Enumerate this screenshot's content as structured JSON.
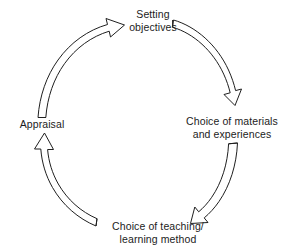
{
  "diagram": {
    "type": "cycle-diagram",
    "direction": "clockwise",
    "background_color": "#ffffff",
    "line_color": "#1f1f1f",
    "text_color": "#1c1c1c",
    "nodes": [
      {
        "id": "setting-objectives",
        "label": "Setting\nobjectives",
        "position": "top"
      },
      {
        "id": "choice-materials",
        "label": "Choice of materials\nand experiences",
        "position": "right"
      },
      {
        "id": "choice-teaching",
        "label": "Choice of teaching/\nlearning method",
        "position": "bottom"
      },
      {
        "id": "appraisal",
        "label": "Appraisal",
        "position": "left"
      }
    ],
    "arrows": [
      {
        "id": "arrow-objectives-to-materials",
        "from": "setting-objectives",
        "to": "choice-materials",
        "style": "hollow-curved-arrow"
      },
      {
        "id": "arrow-materials-to-teaching",
        "from": "choice-materials",
        "to": "choice-teaching",
        "style": "hollow-curved-arrow"
      },
      {
        "id": "arrow-teaching-to-appraisal",
        "from": "choice-teaching",
        "to": "appraisal",
        "style": "hollow-curved-arrow"
      },
      {
        "id": "arrow-appraisal-to-objectives",
        "from": "appraisal",
        "to": "setting-objectives",
        "style": "hollow-curved-arrow"
      }
    ]
  }
}
